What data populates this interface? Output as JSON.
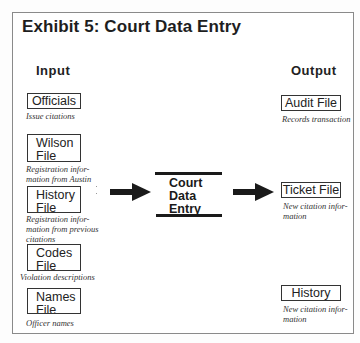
{
  "title": "Exhibit 5: Court Data Entry",
  "input": {
    "heading": "Input",
    "items": [
      {
        "label": [
          "Officials"
        ],
        "caption": [
          "Issue citations"
        ]
      },
      {
        "label": [
          "Wilson",
          "File"
        ],
        "caption": [
          "Registration infor-",
          "mation from Austin"
        ]
      },
      {
        "label": [
          "History",
          "File"
        ],
        "caption": [
          "Registration infor-",
          "mation from previous",
          "citations"
        ]
      },
      {
        "label": [
          "Codes",
          "File"
        ],
        "caption": [
          "Violation descriptions"
        ]
      },
      {
        "label": [
          "Names",
          "File"
        ],
        "caption": [
          "Officer names"
        ]
      }
    ]
  },
  "process": {
    "label": [
      "Court",
      "Data",
      "Entry"
    ]
  },
  "output": {
    "heading": "Output",
    "items": [
      {
        "label": [
          "Audit File"
        ],
        "caption": [
          "Records transaction"
        ]
      },
      {
        "label": [
          "Ticket File"
        ],
        "caption": [
          "New citation infor-",
          "mation"
        ]
      },
      {
        "label": [
          "History File"
        ],
        "caption": [
          "New citation infor-",
          "mation"
        ]
      }
    ]
  },
  "colors": {
    "ink": "#1a1a1a",
    "frame": "#8a8a8a",
    "background": "#ffffff"
  }
}
